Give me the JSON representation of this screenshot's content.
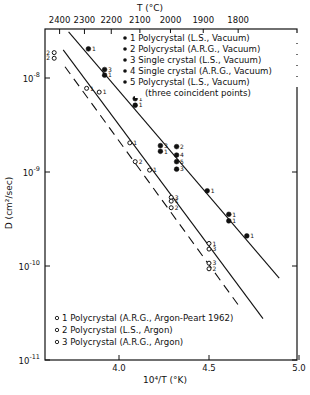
{
  "chart_data": {
    "type": "scatter",
    "title": "",
    "xlabel": "10⁴/T (°K)",
    "ylabel": "D (cm²/sec)",
    "top_axis_label": "T (°C)",
    "xlim": [
      3.59,
      5.0
    ],
    "ylim_log10": [
      -11,
      -7.48
    ],
    "y_scale": "log",
    "grid": false,
    "x_ticks": [
      {
        "value": 4.0,
        "label": "4.0"
      },
      {
        "value": 4.5,
        "label": "4.5"
      },
      {
        "value": 5.0,
        "label": "5.0"
      }
    ],
    "y_ticks": [
      {
        "log10": -8,
        "base": "10",
        "exp": "-8"
      },
      {
        "log10": -9,
        "base": "10",
        "exp": "-9"
      },
      {
        "log10": -10,
        "base": "10",
        "exp": "-10"
      },
      {
        "log10": -11,
        "base": "10",
        "exp": "-11"
      }
    ],
    "top_ticks": [
      {
        "label": "2400",
        "x": 3.67
      },
      {
        "label": "2300",
        "x": 3.808
      },
      {
        "label": "2200",
        "x": 3.957
      },
      {
        "label": "2100",
        "x": 4.116
      },
      {
        "label": "2000",
        "x": 4.286
      },
      {
        "label": "1900",
        "x": 4.468
      },
      {
        "label": "1800",
        "x": 4.662
      }
    ],
    "legend_vacuum": {
      "position": "upper-right",
      "marker": "filled-circle",
      "entries": [
        {
          "id": "1",
          "label": "1 Polycrystal (L.S., Vacuum)"
        },
        {
          "id": "2",
          "label": "2 Polycrystal (A.R.G., Vacuum)"
        },
        {
          "id": "3",
          "label": "3 Single crystal (L.S., Vacuum)"
        },
        {
          "id": "4",
          "label": "4 Single crystal (A.R.G., Vacuum)"
        },
        {
          "id": "5",
          "label": "5 Polycrystal (L.S., Vacuum)"
        }
      ],
      "note": "(three coincident points)"
    },
    "legend_argon": {
      "position": "lower-left",
      "marker": "open-circle",
      "entries": [
        {
          "id": "1",
          "label": "1 Polycrystal (A.R.G., Argon-Peart 1962)"
        },
        {
          "id": "2",
          "label": "2 Polycrystal (L.S., Argon)"
        },
        {
          "id": "3",
          "label": "3 Polycrystal (A.R.G., Argon)"
        }
      ]
    },
    "series": [
      {
        "name": "Vacuum (filled)",
        "marker": "filled",
        "points": [
          {
            "x": 3.83,
            "log10D": -7.69,
            "label": "1"
          },
          {
            "x": 3.92,
            "log10D": -7.91,
            "label": "3"
          },
          {
            "x": 3.92,
            "log10D": -7.97,
            "label": "1"
          },
          {
            "x": 4.09,
            "log10D": -8.22,
            "label": "1"
          },
          {
            "x": 4.09,
            "log10D": -8.29,
            "label": "1"
          },
          {
            "x": 4.23,
            "log10D": -8.72,
            "label": "3"
          },
          {
            "x": 4.23,
            "log10D": -8.78,
            "label": "1"
          },
          {
            "x": 4.32,
            "log10D": -8.73,
            "label": "2"
          },
          {
            "x": 4.32,
            "log10D": -8.82,
            "label": "4"
          },
          {
            "x": 4.32,
            "log10D": -8.89,
            "label": "5"
          },
          {
            "x": 4.32,
            "log10D": -8.97,
            "label": "3"
          },
          {
            "x": 4.49,
            "log10D": -9.2,
            "label": "1"
          },
          {
            "x": 4.61,
            "log10D": -9.45,
            "label": "1"
          },
          {
            "x": 4.61,
            "log10D": -9.52,
            "label": "1"
          },
          {
            "x": 4.71,
            "log10D": -9.68,
            "label": "1"
          }
        ]
      },
      {
        "name": "Argon (open)",
        "marker": "open",
        "points": [
          {
            "x": 3.64,
            "log10D": -7.73,
            "label": "2",
            "label_side": "left"
          },
          {
            "x": 3.64,
            "log10D": -7.79,
            "label": "2",
            "label_side": "left"
          },
          {
            "x": 3.82,
            "log10D": -8.11,
            "label": "1"
          },
          {
            "x": 3.89,
            "log10D": -8.15,
            "label": "1"
          },
          {
            "x": 4.06,
            "log10D": -8.69,
            "label": "1"
          },
          {
            "x": 4.09,
            "log10D": -8.89,
            "label": "2"
          },
          {
            "x": 4.17,
            "log10D": -8.98,
            "label": "1"
          },
          {
            "x": 4.29,
            "log10D": -9.27,
            "label": "3"
          },
          {
            "x": 4.29,
            "log10D": -9.31,
            "label": "1"
          },
          {
            "x": 4.29,
            "log10D": -9.38,
            "label": "2"
          },
          {
            "x": 4.5,
            "log10D": -9.76,
            "label": "1"
          },
          {
            "x": 4.5,
            "log10D": -9.82,
            "label": "3"
          },
          {
            "x": 4.5,
            "log10D": -9.97,
            "label": "3"
          },
          {
            "x": 4.5,
            "log10D": -10.03,
            "label": "2"
          }
        ]
      }
    ],
    "fit_lines": [
      {
        "name": "vacuum-fit",
        "style": "solid",
        "from": {
          "x": 3.72,
          "log10D": -7.51
        },
        "to": {
          "x": 4.89,
          "log10D": -10.13
        }
      },
      {
        "name": "argon-fit-solid",
        "style": "solid",
        "from": {
          "x": 3.69,
          "log10D": -7.7
        },
        "to": {
          "x": 4.8,
          "log10D": -10.56
        }
      },
      {
        "name": "argon-fit-dashed",
        "style": "dashed",
        "from": {
          "x": 3.7,
          "log10D": -7.88
        },
        "to": {
          "x": 4.68,
          "log10D": -10.46
        }
      }
    ]
  }
}
